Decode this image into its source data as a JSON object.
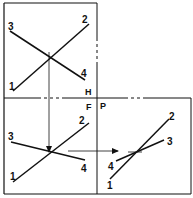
{
  "colors": {
    "ink": "#111111",
    "frame": "#444444",
    "background": "#ffffff"
  },
  "views": {
    "horizontal": {
      "name": "H",
      "points": {
        "p1": "1",
        "p2": "2",
        "p3": "3",
        "p4": "4"
      }
    },
    "frontal": {
      "name": "F",
      "points": {
        "p1": "1",
        "p2": "2",
        "p3": "3",
        "p4": "4"
      }
    },
    "profile": {
      "name": "P",
      "points": {
        "p1": "1",
        "p2": "2",
        "p3": "3",
        "p4": "4"
      }
    }
  }
}
